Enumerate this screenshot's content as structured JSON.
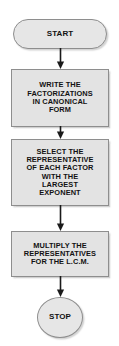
{
  "diagram": {
    "background_color": "#ffffff",
    "node_fill_color": "#e3e3e3",
    "node_border_color": "#8e8e8e",
    "text_color": "#121212",
    "arrow_color": "#1a1a1a"
  },
  "nodes": {
    "start": {
      "label": "START",
      "shape": "terminator"
    },
    "write": {
      "label": "WRITE THE\nFACTORIZATIONS\nIN CANONICAL\nFORM",
      "shape": "process"
    },
    "select": {
      "label": "SELECT THE\nREPRESENTATIVE\nOF EACH FACTOR\nWITH THE\nLARGEST\nEXPONENT",
      "shape": "process"
    },
    "multiply": {
      "label": "MULTIPLY THE\nREPRESENTATIVES\nFOR THE L.C.M.",
      "shape": "process"
    },
    "stop": {
      "label": "STOP",
      "shape": "terminator"
    }
  },
  "connectors": [
    {
      "name": "start-to-write",
      "from": "start",
      "to": "write",
      "direction": "down"
    },
    {
      "name": "write-to-select",
      "from": "write",
      "to": "select",
      "direction": "down"
    },
    {
      "name": "select-to-multiply",
      "from": "select",
      "to": "multiply",
      "direction": "down"
    },
    {
      "name": "multiply-to-stop",
      "from": "multiply",
      "to": "stop",
      "direction": "down"
    }
  ]
}
